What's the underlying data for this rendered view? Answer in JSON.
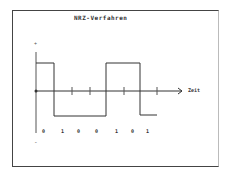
{
  "diagram": {
    "title": "NRZ-Verfahren",
    "axis": {
      "x_label": "Zeit",
      "y_plus": "+",
      "y_minus": "-"
    },
    "bits": [
      "0",
      "1",
      "0",
      "0",
      "1",
      "0",
      "1"
    ],
    "colors": {
      "line": "#333333",
      "frame": "#444444",
      "background": "#ffffff"
    }
  }
}
